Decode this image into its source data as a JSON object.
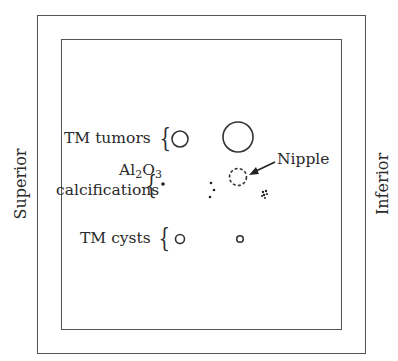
{
  "diagram": {
    "title": "",
    "side_labels": {
      "left": "Superior",
      "right": "Inferior"
    },
    "rows": [
      {
        "label": "TM tumors",
        "type": "circle-outline",
        "items": [
          {
            "x": 180,
            "y": 139,
            "r": 8
          },
          {
            "x": 238,
            "y": 137,
            "r": 15
          }
        ]
      },
      {
        "label_line1": "Al",
        "label_sub1": "2",
        "label_mid": "O",
        "label_sub2": "3",
        "label_line2": "calcifications",
        "type": "dots",
        "items": [
          {
            "x": 163,
            "y": 184,
            "r": 1.8
          },
          {
            "x": 211,
            "y": 183,
            "r": 1.3
          },
          {
            "x": 214,
            "y": 190,
            "r": 1.3
          },
          {
            "x": 210,
            "y": 197,
            "r": 1.3
          },
          {
            "x": 265,
            "y": 194,
            "r": 3,
            "shape": "cluster"
          }
        ]
      },
      {
        "label": "TM cysts",
        "type": "circle-outline",
        "items": [
          {
            "x": 180,
            "y": 239,
            "r": 5
          },
          {
            "x": 240,
            "y": 239,
            "r": 3.5
          }
        ]
      }
    ],
    "nipple": {
      "label": "Nipple",
      "x": 238,
      "y": 177,
      "r": 8,
      "style": "dashed"
    },
    "colors": {
      "stroke": "#333333",
      "frame": "#555555",
      "text": "#2a2a2a"
    }
  }
}
